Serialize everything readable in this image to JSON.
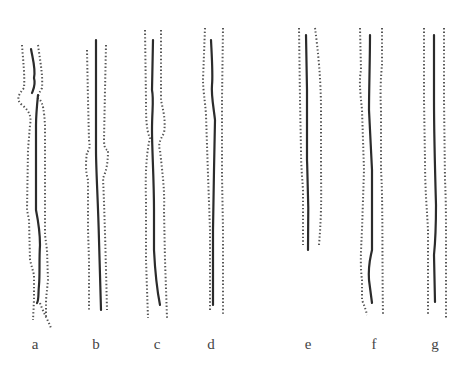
{
  "figure": {
    "panels": [
      {
        "label": "a",
        "x": 35
      },
      {
        "label": "b",
        "x": 96
      },
      {
        "label": "c",
        "x": 157
      },
      {
        "label": "d",
        "x": 211
      },
      {
        "label": "e",
        "x": 308
      },
      {
        "label": "f",
        "x": 374
      },
      {
        "label": "g",
        "x": 435
      }
    ]
  },
  "colors": {
    "line": "#2b2b2b",
    "dotted": "#555555",
    "background": "#ffffff"
  }
}
